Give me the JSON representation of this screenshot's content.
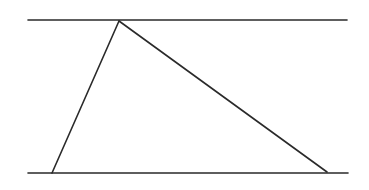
{
  "diagram": {
    "background": "#ffffff",
    "stroke_color": "#2a2a2a",
    "stroke_width": 1.6,
    "parallel_lines": [
      {
        "name": "top-line",
        "x1": 28,
        "y1": 20,
        "x2": 347,
        "y2": 20
      },
      {
        "name": "bottom-line",
        "x1": 28,
        "y1": 173,
        "x2": 348,
        "y2": 173
      }
    ],
    "triangle": {
      "apex": {
        "x": 119,
        "y": 21
      },
      "bottom_left": {
        "x": 52,
        "y": 173
      },
      "bottom_right": {
        "x": 327,
        "y": 172
      }
    }
  }
}
